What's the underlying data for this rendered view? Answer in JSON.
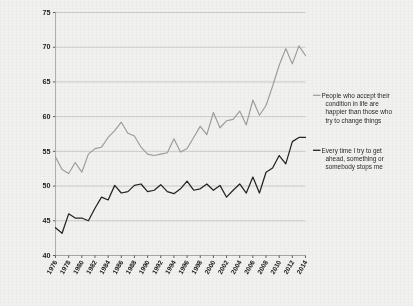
{
  "chart_data": {
    "type": "line",
    "title": "",
    "xlabel": "",
    "ylabel": "",
    "grid": true,
    "legend_position": "right",
    "ylim": [
      40,
      75
    ],
    "yticks": [
      40,
      45,
      50,
      55,
      60,
      65,
      70,
      75
    ],
    "xlim": [
      1976,
      2014
    ],
    "xticks": [
      1976,
      1978,
      1980,
      1982,
      1984,
      1986,
      1988,
      1990,
      1992,
      1994,
      1996,
      1998,
      2000,
      2002,
      2004,
      2006,
      2008,
      2010,
      2012,
      2014
    ],
    "x": [
      1976,
      1977,
      1978,
      1979,
      1980,
      1981,
      1982,
      1983,
      1984,
      1985,
      1986,
      1987,
      1988,
      1989,
      1990,
      1991,
      1992,
      1993,
      1994,
      1995,
      1996,
      1997,
      1998,
      1999,
      2000,
      2001,
      2002,
      2003,
      2004,
      2005,
      2006,
      2007,
      2008,
      2009,
      2010,
      2011,
      2012,
      2013,
      2014
    ],
    "series": [
      {
        "name": "People who accept their condition in life are happier than those who try to change things",
        "color": "#9a9a98",
        "values": [
          54.2,
          52.4,
          51.8,
          53.4,
          52.0,
          54.6,
          55.4,
          55.6,
          57.0,
          58.0,
          59.2,
          57.6,
          57.2,
          55.6,
          54.6,
          54.4,
          54.6,
          54.8,
          56.8,
          54.9,
          55.4,
          57.0,
          58.6,
          57.4,
          60.6,
          58.4,
          59.4,
          59.6,
          60.8,
          58.8,
          62.4,
          60.2,
          61.6,
          64.4,
          67.4,
          69.8,
          67.6,
          70.2,
          68.8
        ]
      },
      {
        "name": "Every time I try to get ahead, something or somebody stops me",
        "color": "#232323",
        "values": [
          44.0,
          43.2,
          46.0,
          45.4,
          45.4,
          45.0,
          46.8,
          48.4,
          48.0,
          50.1,
          49.0,
          49.2,
          50.1,
          50.3,
          49.2,
          49.4,
          50.2,
          49.2,
          48.9,
          49.6,
          50.7,
          49.4,
          49.6,
          50.3,
          49.4,
          50.1,
          48.4,
          49.4,
          50.3,
          49.0,
          51.3,
          49.0,
          52.0,
          52.6,
          54.4,
          53.2,
          56.4,
          57.0,
          57.0
        ]
      }
    ]
  },
  "legend": {
    "items": [
      {
        "label": "People who accept their condition in life are happier than those who try to change things",
        "lines": [
          "People who accept their",
          "condition in life are",
          "happier than those who",
          "try to change things"
        ],
        "color": "#9a9a98"
      },
      {
        "label": "Every time I try to get ahead, something or somebody stops me",
        "lines": [
          "Every time I try to get",
          "ahead, something or",
          "somebody stops me"
        ],
        "color": "#232323"
      }
    ]
  }
}
